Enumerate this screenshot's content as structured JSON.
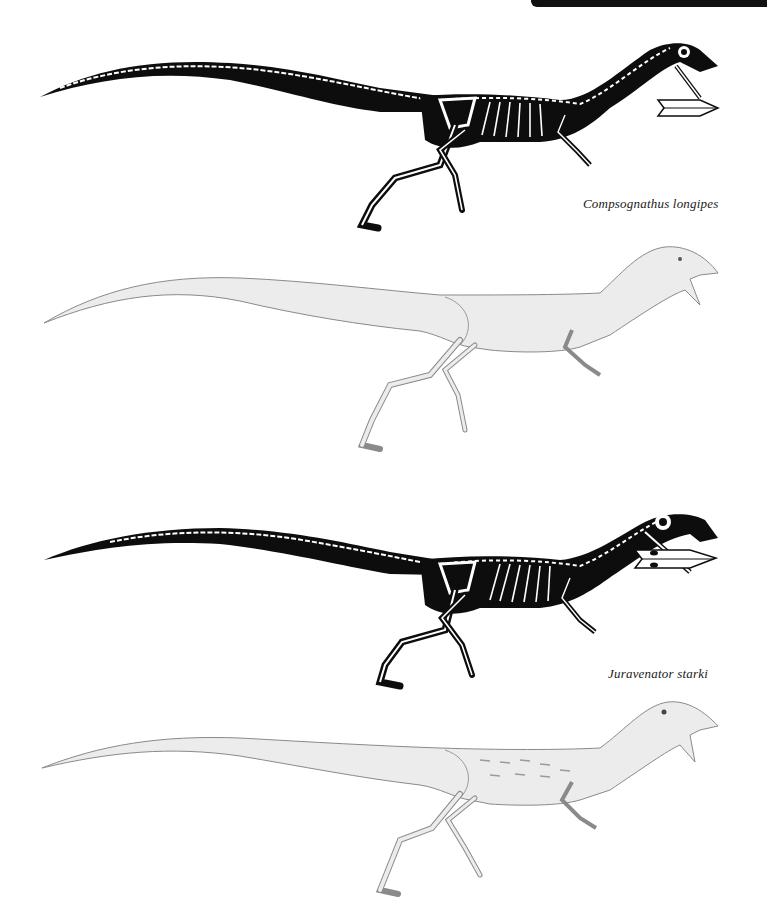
{
  "page": {
    "background": "#ffffff",
    "header_bar_color": "#111111"
  },
  "figures": [
    {
      "species": "Compsognathus longipes",
      "style": "skeletal reconstruction",
      "caption": "Compsognathus longipes"
    },
    {
      "species": "Compsognathus longipes",
      "style": "life restoration (pencil)",
      "caption": ""
    },
    {
      "species": "Juravenator starki",
      "style": "skeletal reconstruction",
      "caption": "Juravenator starki"
    },
    {
      "species": "Juravenator starki",
      "style": "life restoration (pencil)",
      "caption": ""
    }
  ],
  "colors": {
    "silhouette": "#0d0d0d",
    "bone": "#ffffff",
    "pencil_fill": "#ececec",
    "pencil_line": "#8a8a8a",
    "caption_text": "#1a1a1a"
  }
}
